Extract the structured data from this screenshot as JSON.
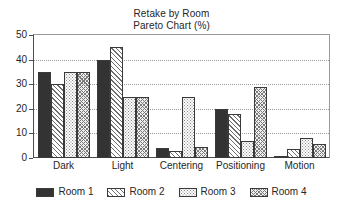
{
  "chart_data": {
    "type": "bar",
    "title": "Retake by Room",
    "subtitle": "Pareto Chart (%)",
    "title_lines": [
      "Retake by Room",
      "Pareto Chart (%)"
    ],
    "xlabel": "",
    "ylabel": "",
    "ylim": [
      0,
      50
    ],
    "ytick_step": 10,
    "yticks": [
      0,
      10,
      20,
      30,
      40,
      50
    ],
    "ytick_labels": [
      "0",
      "10",
      "20",
      "30",
      "40",
      "50"
    ],
    "grid": true,
    "grid_axis": "y",
    "grid_style": "dotted",
    "legend_position": "bottom",
    "categories": [
      "Dark",
      "Light",
      "Centering",
      "Positioning",
      "Motion"
    ],
    "series": [
      {
        "name": "Room 1",
        "pattern": "solid",
        "color": "#333333",
        "values": [
          35,
          40,
          4,
          20,
          0.5
        ]
      },
      {
        "name": "Room 2",
        "pattern": "diagonal-hatch",
        "color": "#6e6e6e",
        "values": [
          30,
          45,
          3,
          18,
          3.5
        ]
      },
      {
        "name": "Room 3",
        "pattern": "dotted",
        "color": "#8a8a8a",
        "values": [
          35,
          25,
          25,
          7,
          8
        ]
      },
      {
        "name": "Room 4",
        "pattern": "mesh-hatch",
        "color": "#7a7a7a",
        "values": [
          35,
          25,
          4.5,
          29,
          5.5
        ]
      }
    ]
  }
}
